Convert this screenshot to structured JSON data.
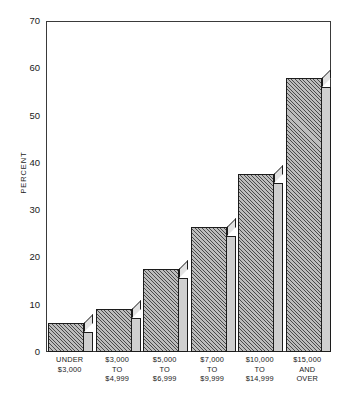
{
  "chart_data": {
    "type": "bar",
    "title": "",
    "subtitle": "",
    "xlabel": "",
    "ylabel": "PERCENT",
    "ylim": [
      0,
      70
    ],
    "ytick_step": 10,
    "yticks": [
      "0",
      "10",
      "20",
      "30",
      "40",
      "50",
      "60",
      "70"
    ],
    "grid": false,
    "legend": "none",
    "style": "3d-hatched-bars",
    "categories": [
      "UNDER $3,000",
      "$3,000 TO $4,999",
      "$5,000 TO $6,999",
      "$7,000 TO $9,999",
      "$10,000 TO $14,999",
      "$15,000 AND OVER"
    ],
    "category_lines": [
      [
        "UNDER",
        "$3,000"
      ],
      [
        "$3,000",
        "TO",
        "$4,999"
      ],
      [
        "$5,000",
        "TO",
        "$6,999"
      ],
      [
        "$7,000",
        "TO",
        "$9,999"
      ],
      [
        "$10,000",
        "TO",
        "$14,999"
      ],
      [
        "$15,000",
        "AND",
        "OVER"
      ]
    ],
    "values": [
      6.1,
      9.1,
      17.6,
      26.5,
      37.6,
      58.0
    ],
    "colors": {
      "bar_face": "#bdbdbd",
      "bar_hatch": "#4a4a4a",
      "bar_side": "#cfcfcf",
      "bar_top": "#e2e2e2",
      "outline": "#1c1c1c",
      "axis": "#3a3a3a",
      "text": "#1a1a1a",
      "background": "#ffffff"
    }
  }
}
